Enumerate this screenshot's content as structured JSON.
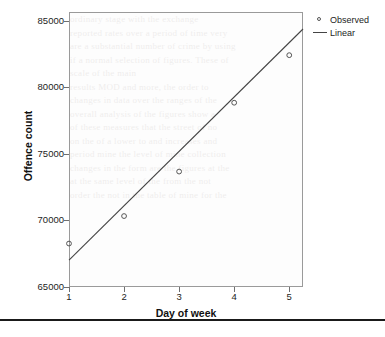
{
  "chart_data": {
    "type": "scatter",
    "title": "",
    "xlabel": "Day of week",
    "ylabel": "Offence count",
    "xlim": [
      1,
      5.25
    ],
    "ylim": [
      65000,
      85700
    ],
    "x_ticks": [
      "1",
      "2",
      "3",
      "4",
      "5"
    ],
    "x_tick_values": [
      1,
      2,
      3,
      4,
      5
    ],
    "y_ticks": [
      "65000",
      "70000",
      "75000",
      "80000",
      "85000"
    ],
    "y_tick_values": [
      65000,
      70000,
      75000,
      80000,
      85000
    ],
    "grid": false,
    "legend_position": "top-right",
    "series": [
      {
        "name": "Observed",
        "type": "scatter",
        "marker": "open-circle",
        "color": "#555555",
        "x": [
          1,
          2,
          3,
          4,
          5
        ],
        "values": [
          68270,
          70340,
          73690,
          78870,
          82450
        ]
      },
      {
        "name": "Linear",
        "type": "line",
        "color": "#444444",
        "x": [
          1,
          5.25
        ],
        "values": [
          67020,
          84420
        ]
      }
    ]
  },
  "legend": {
    "items": [
      {
        "label": "Observed",
        "key": "open-circle-marker"
      },
      {
        "label": "Linear",
        "key": "line-segment"
      }
    ]
  },
  "axes": {
    "x_title": "Day of week",
    "y_title": "Offence count",
    "x_tick_labels": [
      "1",
      "2",
      "3",
      "4",
      "5"
    ],
    "y_tick_labels": [
      "65000",
      "70000",
      "75000",
      "80000",
      "85000"
    ]
  },
  "colors": {
    "frame": "#9a9a9a",
    "marker": "#555555",
    "fit_line": "#444444",
    "text": "#1d1d1d",
    "rule": "#1a1a1a"
  },
  "bleed_through": [
    "ordinary stage with the exchange",
    "reported rates over a period of time very",
    "are a substantial number of crime by using",
    "if a normal selection of figures. These of",
    "scale of the main",
    "results MOD and more, the order to",
    "changes in data over the ranges of the",
    "overall analysis of the figures show a",
    "of these measures that the street of no",
    "on the of a lower to and increases and",
    "period mine the level of mine collection",
    "changes in the form are the figures at the",
    "at the same level of the from the not",
    "order the not in the table of mine for the"
  ]
}
